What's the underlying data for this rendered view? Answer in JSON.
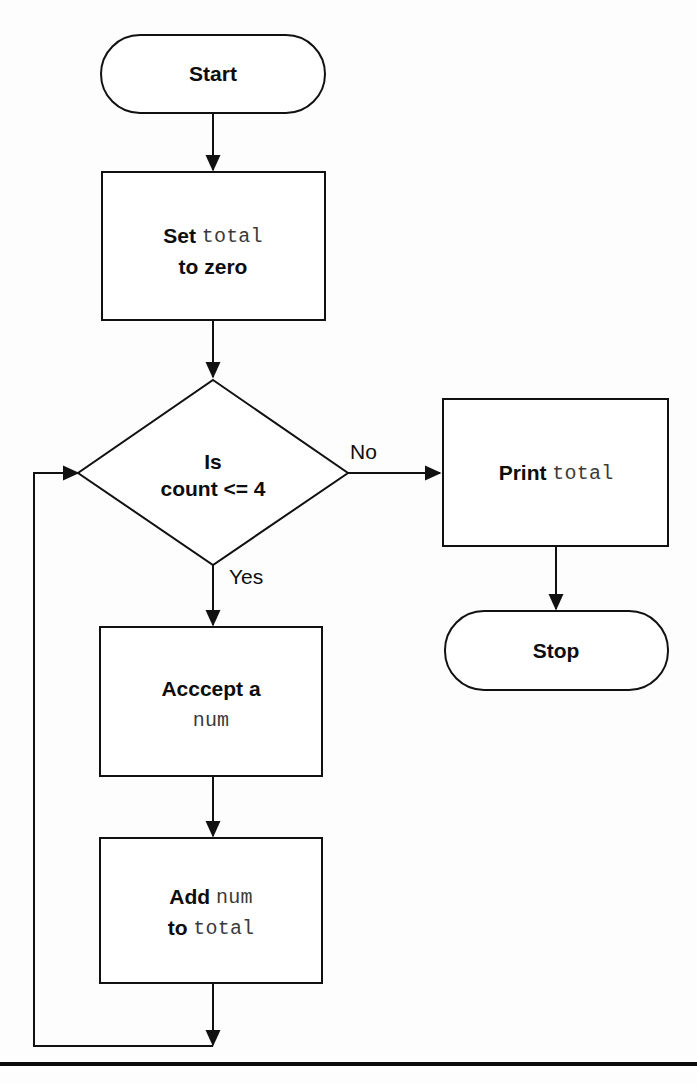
{
  "diagram": {
    "type": "flowchart",
    "background_color": "#fdfdfd",
    "stroke_color": "#111111",
    "text_color": "#0d0d0d",
    "mono_text_color": "#3a3a3a"
  },
  "nodes": {
    "start": {
      "shape": "terminator",
      "label": "Start"
    },
    "set_total": {
      "shape": "process",
      "line1_plain": "Set ",
      "line1_mono": "total",
      "line2_plain": "to zero"
    },
    "decision": {
      "shape": "decision",
      "line1": "Is",
      "line2": "count <= 4"
    },
    "print_total": {
      "shape": "process",
      "plain": "Print ",
      "mono": "total"
    },
    "stop": {
      "shape": "terminator",
      "label": "Stop"
    },
    "accept_num": {
      "shape": "process",
      "line1_plain": "Acccept a",
      "line2_mono": "num"
    },
    "add_num": {
      "shape": "process",
      "line1_plain": "Add ",
      "line1_mono": "num",
      "line2_plain": "to ",
      "line2_mono": "total"
    }
  },
  "edges": {
    "no_label": "No",
    "yes_label": "Yes"
  }
}
